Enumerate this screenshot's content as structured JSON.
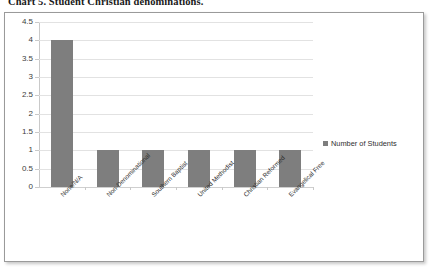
{
  "caption": "Chart 5. Student Christian denominations.",
  "chart_data": {
    "type": "bar",
    "title": "Chart 5. Student Christian denominations.",
    "xlabel": "",
    "ylabel": "",
    "categories": [
      "None/N/A",
      "Non-Denominational",
      "Southern Baptist",
      "United Methodist",
      "Christian Reformed",
      "Evangelical Free"
    ],
    "series": [
      {
        "name": "Number of Students",
        "values": [
          4,
          1,
          1,
          1,
          1,
          1
        ],
        "color": "#7e7e7e"
      }
    ],
    "ylim": [
      0,
      4.5
    ],
    "ytick_step": 0.5,
    "ytick_labels": [
      "0",
      "0.5",
      "1",
      "1.5",
      "2",
      "2.5",
      "3",
      "3.5",
      "4",
      "4.5"
    ],
    "grid": true,
    "grid_color": "#e2e2e2",
    "legend": {
      "position": "right",
      "entries": [
        "Number of Students"
      ]
    },
    "label_rotation_deg": -45,
    "background": "#ffffff",
    "frame_border_color": "#9a9a9a"
  }
}
